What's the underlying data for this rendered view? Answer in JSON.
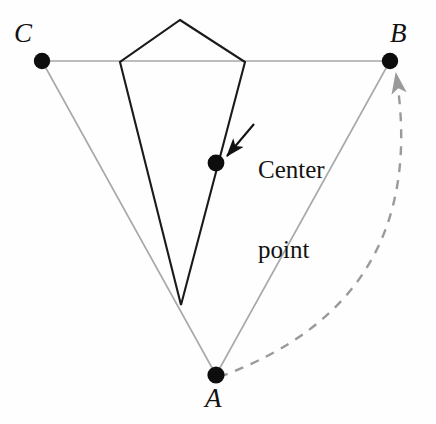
{
  "figure": {
    "type": "geometry-diagram",
    "background_color": "#fefefe",
    "width": 436,
    "height": 424,
    "colors": {
      "triangle_stroke": "#a8a8a8",
      "kite_stroke": "#1a1a1a",
      "dot_fill": "#0d0d0d",
      "arc_stroke": "#9a9a9a",
      "arrow_stroke": "#121212",
      "text": "#121212"
    },
    "vertices": [
      {
        "name": "C",
        "label": "C",
        "x": 42,
        "y": 61,
        "label_x": 14,
        "label_y": 20
      },
      {
        "name": "B",
        "label": "B",
        "x": 390,
        "y": 61,
        "label_x": 390,
        "label_y": 20
      },
      {
        "name": "A",
        "label": "A",
        "x": 216,
        "y": 375,
        "label_x": 205,
        "label_y": 385
      }
    ],
    "center_point": {
      "name": "center-point",
      "x": 216,
      "y": 163
    },
    "kite_vertices": [
      {
        "x": 180,
        "y": 20
      },
      {
        "x": 245,
        "y": 62
      },
      {
        "x": 181,
        "y": 305
      },
      {
        "x": 120,
        "y": 62
      }
    ],
    "callout": {
      "line1": "Center",
      "line2": "point",
      "x": 258,
      "y": 104,
      "arrow_from_x": 252,
      "arrow_from_y": 122,
      "arrow_to_x": 226,
      "arrow_to_y": 157
    },
    "arc": {
      "name": "rotation-arc",
      "from_x": 216,
      "from_y": 375,
      "to_x": 398,
      "to_y": 72,
      "control_x": 432,
      "control_y": 300,
      "dash": "9 8"
    }
  }
}
